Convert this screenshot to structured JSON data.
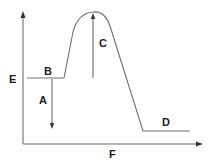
{
  "diagram": {
    "type": "energy-profile",
    "axes": {
      "y_label": "E",
      "x_label": "F"
    },
    "labels": {
      "reactant_level": "B",
      "product_level": "D",
      "drop_arrow": "A",
      "rise_arrow": "C"
    },
    "colors": {
      "line": "#6e6e6e",
      "text": "#1a1a1a",
      "arrowhead": "#333333",
      "background": "#ffffff"
    }
  }
}
